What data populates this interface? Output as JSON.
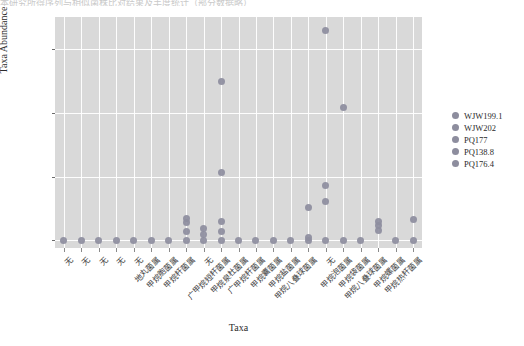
{
  "top_faint_text": "本研究所得序列与相似菌株比对结果及丰度统计（部分数据略）",
  "chart_data": {
    "type": "scatter",
    "title": "",
    "xlabel": "Taxa",
    "ylabel": "Taxa Abundance",
    "ylim": [
      -600,
      17500
    ],
    "yticks": [
      0,
      5000,
      10000,
      15000
    ],
    "ytick_labels": [
      "0",
      "5000",
      "10000",
      "15000"
    ],
    "grid": true,
    "legend_position": "right",
    "legend": [
      "WJW199.1",
      "WJW202",
      "PQ177",
      "PQ138.8",
      "PQ176.4"
    ],
    "point_color": "#8d8d9e",
    "panel_color": "#d9d9d9",
    "grid_color": "#ffffff",
    "categories": [
      "无",
      "无",
      "无",
      "无",
      "无",
      "地丸菌属",
      "甲烷胞菌属",
      "甲烷杆菌属",
      "无",
      "广甲烷短杆菌属",
      "甲烷泉杜菌属",
      "广甲烷杆菌属",
      "甲烷囊菌属",
      "甲烷盐菌属",
      "甲烷八叠球菌属",
      "无",
      "甲烷泡菌属",
      "甲烷袋菌属",
      "甲烷八叠球菌属",
      "甲烷螺菌属",
      "甲烷热杆菌属"
    ],
    "series": [
      {
        "name": "WJW199.1",
        "values": [
          0,
          0,
          0,
          0,
          0,
          0,
          0,
          1750,
          0,
          1450,
          0,
          0,
          0,
          0,
          2550,
          16450,
          10400,
          1850,
          0,
          0,
          1650
        ]
      },
      {
        "name": "WJW202",
        "values": [
          0,
          0,
          0,
          0,
          0,
          0,
          0,
          1500,
          0,
          12450,
          0,
          0,
          0,
          0,
          0,
          4300,
          1250,
          0,
          0,
          0,
          0
        ]
      },
      {
        "name": "PQ177",
        "values": [
          0,
          0,
          0,
          0,
          0,
          0,
          0,
          200,
          0,
          5350,
          0,
          0,
          0,
          0,
          0,
          3050,
          800,
          0,
          0,
          0,
          0
        ]
      },
      {
        "name": "PQ138.8",
        "values": [
          0,
          0,
          0,
          0,
          0,
          0,
          0,
          0,
          900,
          0,
          0,
          0,
          0,
          0,
          0,
          200,
          0,
          0,
          0,
          0,
          0
        ]
      },
      {
        "name": "PQ176.4",
        "values": [
          0,
          0,
          0,
          0,
          0,
          0,
          0,
          0,
          400,
          0,
          0,
          0,
          0,
          0,
          0,
          0,
          0,
          0,
          0,
          0,
          0
        ]
      }
    ],
    "points": [
      {
        "x": 0,
        "y": 0
      },
      {
        "x": 1,
        "y": 0
      },
      {
        "x": 2,
        "y": 0
      },
      {
        "x": 3,
        "y": 0
      },
      {
        "x": 4,
        "y": 0
      },
      {
        "x": 5,
        "y": 0
      },
      {
        "x": 6,
        "y": 0
      },
      {
        "x": 7,
        "y": 0
      },
      {
        "x": 7,
        "y": 700
      },
      {
        "x": 7,
        "y": 1400
      },
      {
        "x": 7,
        "y": 1700
      },
      {
        "x": 8,
        "y": 0
      },
      {
        "x": 8,
        "y": 450
      },
      {
        "x": 8,
        "y": 900
      },
      {
        "x": 9,
        "y": 0
      },
      {
        "x": 9,
        "y": 700
      },
      {
        "x": 9,
        "y": 1450
      },
      {
        "x": 9,
        "y": 5350
      },
      {
        "x": 9,
        "y": 12450
      },
      {
        "x": 10,
        "y": 0
      },
      {
        "x": 11,
        "y": 0
      },
      {
        "x": 12,
        "y": 0
      },
      {
        "x": 13,
        "y": 0
      },
      {
        "x": 14,
        "y": 0
      },
      {
        "x": 14,
        "y": 250
      },
      {
        "x": 14,
        "y": 2550
      },
      {
        "x": 15,
        "y": 0
      },
      {
        "x": 15,
        "y": 3050
      },
      {
        "x": 15,
        "y": 4300
      },
      {
        "x": 15,
        "y": 16450
      },
      {
        "x": 16,
        "y": 0
      },
      {
        "x": 16,
        "y": 10400
      },
      {
        "x": 17,
        "y": 0
      },
      {
        "x": 18,
        "y": 800
      },
      {
        "x": 18,
        "y": 1150
      },
      {
        "x": 18,
        "y": 1450
      },
      {
        "x": 19,
        "y": 0
      },
      {
        "x": 20,
        "y": 0
      },
      {
        "x": 20,
        "y": 1650
      }
    ]
  }
}
